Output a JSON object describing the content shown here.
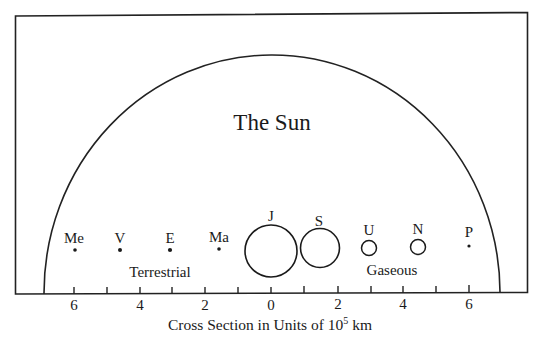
{
  "title": "The Sun",
  "groups": {
    "terrestrial": "Terrestrial",
    "gaseous": "Gaseous"
  },
  "planets": [
    {
      "abbr": "Me",
      "name": "Mercury",
      "x_units": -6,
      "kind": "dot"
    },
    {
      "abbr": "V",
      "name": "Venus",
      "x_units": -4.7,
      "kind": "dot"
    },
    {
      "abbr": "E",
      "name": "Earth",
      "x_units": -3.1,
      "kind": "dot"
    },
    {
      "abbr": "Ma",
      "name": "Mars",
      "x_units": -1.6,
      "kind": "dot"
    },
    {
      "abbr": "J",
      "name": "Jupiter",
      "x_units": 0,
      "kind": "circle",
      "radius_units": 0.78
    },
    {
      "abbr": "S",
      "name": "Saturn",
      "x_units": 1.45,
      "kind": "circle",
      "radius_units": 0.6
    },
    {
      "abbr": "U",
      "name": "Uranus",
      "x_units": 2.95,
      "kind": "circle",
      "radius_units": 0.22
    },
    {
      "abbr": "N",
      "name": "Neptune",
      "x_units": 4.45,
      "kind": "circle",
      "radius_units": 0.22
    },
    {
      "abbr": "P",
      "name": "Pluto",
      "x_units": 6,
      "kind": "dot"
    }
  ],
  "axis": {
    "label_prefix": "Cross Section in Units of 10",
    "label_exponent": "5",
    "label_suffix": " km",
    "tick_labels": [
      "6",
      "4",
      "2",
      "0",
      "2",
      "4",
      "6"
    ]
  },
  "sun_radius_units": 7
}
